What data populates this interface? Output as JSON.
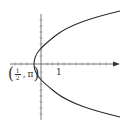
{
  "figure": {
    "curve_color": "#2b2b2b",
    "axis_color": "#555555",
    "x_axis": {
      "tick_label": "1",
      "has_arrow": true
    },
    "y_axis": {
      "has_arrow": false
    },
    "vertex_label": {
      "open": "(",
      "numerator": "1",
      "denominator": "2",
      "comma": ",",
      "second": "π",
      "close": ")"
    }
  }
}
